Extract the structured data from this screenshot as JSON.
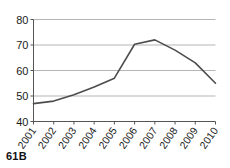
{
  "caption": {
    "label": "61B"
  },
  "chart_data": {
    "type": "line",
    "title": "",
    "subtitle": "",
    "xlabel": "",
    "ylabel": "",
    "categories": [
      "2001",
      "2002",
      "2003",
      "2004",
      "2005",
      "2006",
      "2007",
      "2008",
      "2009",
      "2010"
    ],
    "values": [
      47,
      48,
      50.5,
      53.5,
      57,
      70.3,
      72,
      68,
      63,
      55
    ],
    "series": [
      {
        "name": "series-1",
        "values": [
          47,
          48,
          50.5,
          53.5,
          57,
          70.3,
          72,
          68,
          63,
          55
        ]
      }
    ],
    "ylim": [
      40,
      80
    ],
    "yticks": [
      40,
      50,
      60,
      70,
      80
    ],
    "ytick_labels": [
      "40",
      "50",
      "60",
      "70",
      "80"
    ],
    "xtick_labels": [
      "2001",
      "2002",
      "2003",
      "2004",
      "2005",
      "2006",
      "2007",
      "2008",
      "2009",
      "2010"
    ],
    "xtick_rotation": -55,
    "grid": true,
    "grid_axis": "y",
    "legend": false,
    "legend_position": "none",
    "line_color": "#4d4d4d",
    "grid_color": "#b5b5b5",
    "axis_color": "#555555",
    "background_color": "#ffffff",
    "markers": false,
    "annotations": []
  }
}
